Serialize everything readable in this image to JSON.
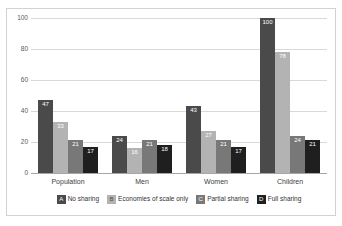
{
  "chart_data": {
    "type": "bar",
    "title": "",
    "subtitle": "",
    "xlabel": "",
    "ylabel": "",
    "ylim": [
      0,
      100
    ],
    "yticks": [
      "0",
      "20",
      "40",
      "60",
      "80",
      "100"
    ],
    "grid": true,
    "legend_position": "bottom",
    "categories": [
      "Population",
      "Men",
      "Women",
      "Children"
    ],
    "series": [
      {
        "name": "No sharing",
        "key": "A",
        "color": "#4a4a4a",
        "values": [
          47,
          24,
          43,
          100
        ]
      },
      {
        "name": "Economies of scale only",
        "key": "B",
        "color": "#b3b3b3",
        "values": [
          33,
          16,
          27,
          78
        ]
      },
      {
        "name": "Partial sharing",
        "key": "C",
        "color": "#787878",
        "values": [
          21,
          21,
          21,
          24
        ]
      },
      {
        "name": "Full sharing",
        "key": "D",
        "color": "#1f1f1f",
        "values": [
          17,
          18,
          17,
          21
        ]
      }
    ]
  },
  "colors": {
    "frame_border": "#d2d2d2",
    "gridline": "#d9d9d9",
    "axis": "#a6a6a6",
    "tick_text": "#595959",
    "category_text": "#404040",
    "legend_text": "#333333",
    "data_label_text": "#ffffff",
    "background": "#ffffff"
  }
}
